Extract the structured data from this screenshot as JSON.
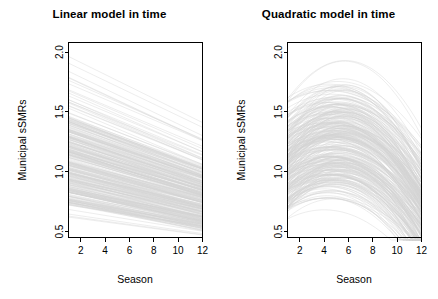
{
  "figure": {
    "background_color": "#ffffff",
    "line_color": "#d4d4d4",
    "axis_color": "#000000",
    "n_panels": 2
  },
  "chart_data": [
    {
      "type": "line",
      "title": "Linear model in time",
      "xlabel": "Season",
      "ylabel": "Municipal sSMRs",
      "xlim": [
        1,
        12
      ],
      "ylim": [
        0.45,
        2.08
      ],
      "xticks": [
        2,
        4,
        6,
        8,
        10,
        12
      ],
      "yticks": [
        0.5,
        1.0,
        1.5,
        2.0
      ],
      "ytick_labels": [
        "0.5",
        "1.0",
        "1.5",
        "2.0"
      ],
      "xtick_labels": [
        "2",
        "4",
        "6",
        "8",
        "10",
        "12"
      ],
      "grid": false,
      "legend": "none",
      "x": [
        1,
        12
      ],
      "description": "Spaghetti plot of municipal standardized SMR trajectories under a linear-in-time model; all series are straight lines declining from season 1 to season 12.",
      "n_series": 300,
      "series_summary": {
        "start_range": [
          0.62,
          2.02
        ],
        "end_range": [
          0.47,
          1.45
        ],
        "dense_band_start": [
          0.72,
          1.45
        ],
        "dense_band_end": [
          0.52,
          1.02
        ],
        "shape": "monotonic-decreasing-linear"
      },
      "series": [
        {
          "name": "envelope-upper",
          "values": [
            2.02,
            1.45
          ]
        },
        {
          "name": "envelope-dense-upper",
          "values": [
            1.45,
            1.02
          ]
        },
        {
          "name": "envelope-dense-lower",
          "values": [
            0.72,
            0.52
          ]
        },
        {
          "name": "envelope-lower",
          "values": [
            0.62,
            0.47
          ]
        }
      ]
    },
    {
      "type": "line",
      "title": "Quadratic model in time",
      "xlabel": "Season",
      "ylabel": "Municipal sSMRs",
      "xlim": [
        1,
        12
      ],
      "ylim": [
        0.45,
        2.08
      ],
      "xticks": [
        2,
        4,
        6,
        8,
        10,
        12
      ],
      "yticks": [
        0.5,
        1.0,
        1.5,
        2.0
      ],
      "ytick_labels": [
        "0.5",
        "1.0",
        "1.5",
        "2.0"
      ],
      "xtick_labels": [
        "2",
        "4",
        "6",
        "8",
        "10",
        "12"
      ],
      "grid": false,
      "legend": "none",
      "x": [
        1,
        2,
        3,
        4,
        5,
        6,
        7,
        8,
        9,
        10,
        11,
        12
      ],
      "description": "Spaghetti plot of municipal standardized SMR trajectories under a quadratic-in-time model; series rise to a peak near season 4-5 then decline toward season 12.",
      "n_series": 300,
      "series_summary": {
        "start_range": [
          0.6,
          1.62
        ],
        "peak_season_range": [
          4,
          6
        ],
        "peak_range": [
          0.7,
          1.92
        ],
        "end_range": [
          0.45,
          1.3
        ],
        "dense_band_start": [
          0.68,
          1.32
        ],
        "shape": "concave-down-parabolic"
      },
      "series": [
        {
          "name": "envelope-upper",
          "values": [
            1.62,
            1.78,
            1.88,
            1.92,
            1.92,
            1.86,
            1.76,
            1.64,
            1.52,
            1.42,
            1.34,
            1.3
          ]
        },
        {
          "name": "envelope-dense-upper",
          "values": [
            1.32,
            1.4,
            1.45,
            1.47,
            1.46,
            1.42,
            1.35,
            1.27,
            1.18,
            1.1,
            1.03,
            0.98
          ]
        },
        {
          "name": "envelope-dense-lower",
          "values": [
            0.68,
            0.74,
            0.78,
            0.8,
            0.8,
            0.78,
            0.74,
            0.69,
            0.64,
            0.59,
            0.55,
            0.52
          ]
        },
        {
          "name": "envelope-lower",
          "values": [
            0.6,
            0.64,
            0.67,
            0.69,
            0.69,
            0.67,
            0.63,
            0.59,
            0.54,
            0.5,
            0.47,
            0.45
          ]
        }
      ]
    }
  ],
  "panels": [
    {
      "id": "linear",
      "title": "Linear model in time",
      "xlabel": "Season",
      "ylabel": "Municipal sSMRs",
      "xtick_labels": [
        "2",
        "4",
        "6",
        "8",
        "10",
        "12"
      ],
      "ytick_labels": [
        "0.5",
        "1.0",
        "1.5",
        "2.0"
      ]
    },
    {
      "id": "quadratic",
      "title": "Quadratic model in time",
      "xlabel": "Season",
      "ylabel": "Municipal sSMRs",
      "xtick_labels": [
        "2",
        "4",
        "6",
        "8",
        "10",
        "12"
      ],
      "ytick_labels": [
        "0.5",
        "1.0",
        "1.5",
        "2.0"
      ]
    }
  ]
}
